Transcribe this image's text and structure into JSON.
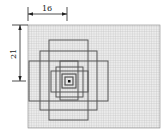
{
  "diagram": {
    "type": "nested-square-frames-on-grid",
    "dimensions": {
      "horizontal": {
        "label": "16"
      },
      "vertical": {
        "label": "21"
      }
    },
    "colors": {
      "grid_background": "#e6e6e6",
      "grid_line": "#bdbdbd",
      "frame_stroke": "#555555",
      "dimension_line": "#222222",
      "center_marker": "#111111"
    }
  }
}
